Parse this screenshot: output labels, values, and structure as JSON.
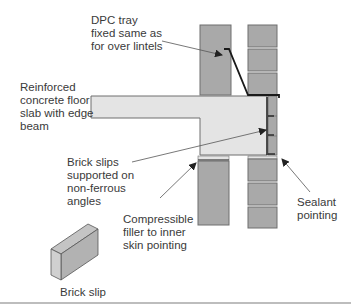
{
  "labels": {
    "dpc_tray": "DPC tray\nfixed same as\nfor over lintels",
    "slab": "Reinforced\nconcrete floor\nslab with edge\nbeam",
    "brick_slips": "Brick slips\nsupported on\nnon-ferrous\nangles",
    "filler": "Compressible\nfiller to inner\nskin pointing",
    "sealant": "Sealant\npointing",
    "brick_slip": "Brick slip"
  },
  "colors": {
    "brick": "#a9a9a9",
    "slab": "#e4e4e4",
    "outline": "#6e6e6e",
    "dpc": "#1a1a1a",
    "text": "#3a3a3a",
    "leader": "#555555"
  }
}
